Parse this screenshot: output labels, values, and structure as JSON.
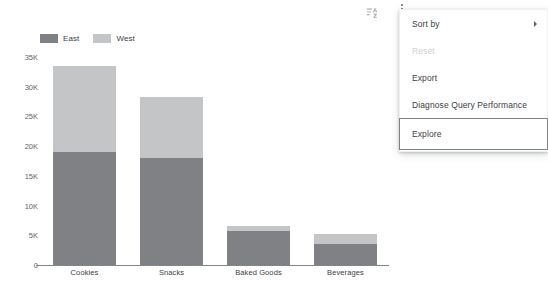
{
  "toolbar": {
    "sort_icon_name": "sort-az-icon",
    "more_icon_name": "more-vert-icon"
  },
  "menu": {
    "items": [
      {
        "label": "Sort by",
        "state": "normal",
        "has_submenu": true
      },
      {
        "label": "Reset",
        "state": "disabled",
        "has_submenu": false
      },
      {
        "label": "Export",
        "state": "normal",
        "has_submenu": false
      },
      {
        "label": "Diagnose Query Performance",
        "state": "normal",
        "has_submenu": false
      },
      {
        "label": "Explore",
        "state": "highlighted",
        "has_submenu": false
      }
    ]
  },
  "chart_data": {
    "type": "bar",
    "stacked": true,
    "title": "",
    "xlabel": "",
    "ylabel": "",
    "categories": [
      "Cookies",
      "Snacks",
      "Baked Goods",
      "Beverages"
    ],
    "series": [
      {
        "name": "East",
        "color": "#7f8184",
        "values": [
          19000,
          18000,
          5800,
          3500
        ]
      },
      {
        "name": "West",
        "color": "#c3c5c7",
        "values": [
          14500,
          10200,
          700,
          1700
        ]
      }
    ],
    "totals": [
      33500,
      28200,
      6500,
      5200
    ],
    "ylim": [
      0,
      36500
    ],
    "yticks": [
      0,
      5000,
      10000,
      15000,
      20000,
      25000,
      30000,
      35000
    ],
    "ytick_labels": [
      "0",
      "5K",
      "10K",
      "15K",
      "20K",
      "25K",
      "30K",
      "35K"
    ],
    "grid": false,
    "legend_position": "top-left"
  }
}
